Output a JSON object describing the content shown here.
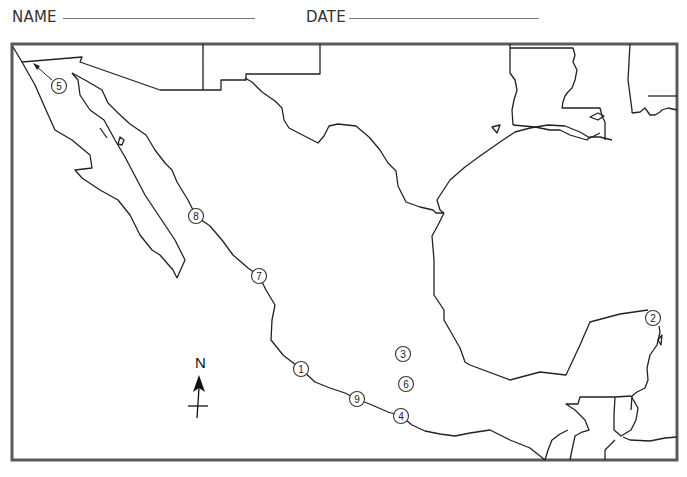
{
  "worksheet": {
    "name_label": "NAME",
    "date_label": "DATE"
  },
  "map": {
    "subject": "Mexico and surrounding region outline map",
    "border_color": "#5a5a5a",
    "line_color": "#222222",
    "compass": {
      "label": "N"
    },
    "markers": [
      {
        "id": "1",
        "label": "1",
        "x": 301,
        "y": 369
      },
      {
        "id": "2",
        "label": "2",
        "x": 653,
        "y": 318
      },
      {
        "id": "3",
        "label": "3",
        "x": 403,
        "y": 354
      },
      {
        "id": "4",
        "label": "4",
        "x": 401,
        "y": 416
      },
      {
        "id": "5",
        "label": "5",
        "x": 59,
        "y": 86
      },
      {
        "id": "6",
        "label": "6",
        "x": 406,
        "y": 384
      },
      {
        "id": "7",
        "label": "7",
        "x": 259,
        "y": 276
      },
      {
        "id": "8",
        "label": "8",
        "x": 196,
        "y": 216
      },
      {
        "id": "9",
        "label": "9",
        "x": 357,
        "y": 399
      }
    ]
  }
}
